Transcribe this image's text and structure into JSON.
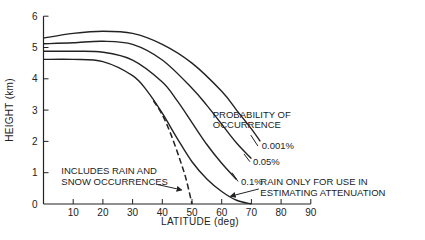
{
  "chart_data": {
    "type": "line",
    "title": "",
    "xlabel": "LATITUDE (deg)",
    "ylabel": "HEIGHT (km)",
    "xlim": [
      0,
      90
    ],
    "ylim": [
      0,
      6
    ],
    "x_ticks": [
      10,
      20,
      30,
      40,
      50,
      60,
      70,
      80,
      90
    ],
    "y_ticks": [
      0,
      1,
      2,
      3,
      4,
      5,
      6
    ],
    "grid": false,
    "legend": null,
    "series": [
      {
        "name": "0.001%",
        "style": "solid",
        "points": [
          [
            0,
            5.3
          ],
          [
            10,
            5.45
          ],
          [
            20,
            5.52
          ],
          [
            30,
            5.45
          ],
          [
            40,
            5.1
          ],
          [
            50,
            4.5
          ],
          [
            60,
            3.6
          ],
          [
            65,
            3.0
          ],
          [
            70,
            2.4
          ],
          [
            73,
            2.0
          ]
        ]
      },
      {
        "name": "0.05%",
        "style": "solid",
        "points": [
          [
            0,
            5.12
          ],
          [
            10,
            5.15
          ],
          [
            20,
            5.2
          ],
          [
            30,
            5.1
          ],
          [
            40,
            4.6
          ],
          [
            50,
            3.7
          ],
          [
            55,
            3.15
          ],
          [
            60,
            2.55
          ],
          [
            65,
            1.95
          ],
          [
            70,
            1.45
          ]
        ]
      },
      {
        "name": "0.1%",
        "style": "solid",
        "points": [
          [
            0,
            4.88
          ],
          [
            10,
            4.88
          ],
          [
            20,
            4.85
          ],
          [
            30,
            4.6
          ],
          [
            40,
            3.9
          ],
          [
            45,
            3.3
          ],
          [
            50,
            2.6
          ],
          [
            55,
            1.9
          ],
          [
            60,
            1.3
          ],
          [
            65,
            0.78
          ]
        ]
      },
      {
        "name": "RAIN ONLY FOR USE IN ESTIMATING ATTENUATION",
        "style": "solid",
        "points": [
          [
            0,
            4.62
          ],
          [
            10,
            4.62
          ],
          [
            20,
            4.55
          ],
          [
            30,
            4.1
          ],
          [
            35,
            3.6
          ],
          [
            40,
            2.9
          ],
          [
            45,
            2.1
          ],
          [
            50,
            1.35
          ],
          [
            55,
            0.8
          ],
          [
            60,
            0.4
          ],
          [
            65,
            0.12
          ],
          [
            70,
            0.0
          ]
        ]
      },
      {
        "name": "INCLUDES RAIN AND SNOW OCCURRENCES",
        "style": "dashed",
        "points": [
          [
            37,
            3.3
          ],
          [
            40,
            2.85
          ],
          [
            43,
            2.2
          ],
          [
            46,
            1.4
          ],
          [
            48,
            0.8
          ],
          [
            50,
            0.0
          ]
        ]
      }
    ],
    "annotations": [
      {
        "text": "PROBABILITY OF",
        "x": 57,
        "y": 2.75
      },
      {
        "text": "OCCURRENCE",
        "x": 57,
        "y": 2.43
      },
      {
        "text": "0.001%",
        "x": 73.5,
        "y": 1.75
      },
      {
        "text": "0.05%",
        "x": 70.5,
        "y": 1.25
      },
      {
        "text": "0.1%",
        "x": 66.5,
        "y": 0.62
      },
      {
        "text": "RAIN ONLY FOR USE IN",
        "x": 73,
        "y": 0.62
      },
      {
        "text": "ESTIMATING ATTENUATION",
        "x": 73,
        "y": 0.25
      },
      {
        "text": "INCLUDES RAIN AND",
        "x": 6,
        "y": 0.95
      },
      {
        "text": "SNOW OCCURRENCES",
        "x": 6,
        "y": 0.6
      }
    ]
  }
}
